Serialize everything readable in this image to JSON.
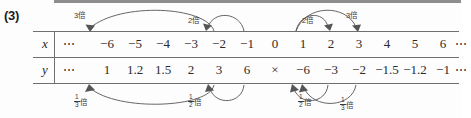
{
  "problem": {
    "number": "(3)"
  },
  "table": {
    "rows": [
      {
        "label": "x",
        "name": "row-x",
        "cells": [
          "⋯",
          "−6",
          "−5",
          "−4",
          "−3",
          "−2",
          "−1",
          "0",
          "1",
          "2",
          "3",
          "4",
          "5",
          "6",
          "⋯"
        ]
      },
      {
        "label": "y",
        "name": "row-y",
        "cells": [
          "⋯",
          "1",
          "1.2",
          "1.5",
          "2",
          "3",
          "6",
          "×",
          "−6",
          "−3",
          "−2",
          "−1.5",
          "−1.2",
          "−1",
          "⋯"
        ]
      }
    ]
  },
  "annotations": {
    "top": [
      {
        "id": "top-left-3bai",
        "text": "3倍",
        "multiplier": "3",
        "suffix": "倍",
        "from": "−2",
        "to": "−6"
      },
      {
        "id": "top-left-2bai",
        "text": "2倍",
        "multiplier": "2",
        "suffix": "倍",
        "from": "−1",
        "to": "−2"
      },
      {
        "id": "top-right-2bai",
        "text": "2倍",
        "multiplier": "2",
        "suffix": "倍",
        "from": "1",
        "to": "2"
      },
      {
        "id": "top-right-3bai",
        "text": "3倍",
        "multiplier": "3",
        "suffix": "倍",
        "from": "1",
        "to": "3"
      }
    ],
    "bottom": [
      {
        "id": "bottom-left-third",
        "numerator": "1",
        "denominator": "3",
        "suffix": "倍",
        "from": "−2",
        "to": "−6"
      },
      {
        "id": "bottom-left-half",
        "numerator": "1",
        "denominator": "2",
        "suffix": "倍",
        "from": "−1",
        "to": "−2"
      },
      {
        "id": "bottom-right-half",
        "numerator": "1",
        "denominator": "2",
        "suffix": "倍",
        "from": "1",
        "to": "2"
      },
      {
        "id": "bottom-right-third",
        "numerator": "1",
        "denominator": "3",
        "suffix": "倍",
        "from": "1",
        "to": "3"
      }
    ]
  },
  "colors": {
    "rule": "#6f6f6f",
    "text": "#2b2b2b",
    "arrow": "#555555",
    "top_strip": "#8d8d8d"
  }
}
